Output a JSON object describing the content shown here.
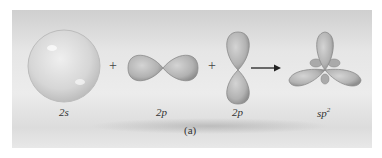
{
  "figure": {
    "caption": "(a)",
    "orbitals": [
      {
        "label_main": "2",
        "label_sub": "s",
        "shape": "sphere"
      },
      {
        "label_main": "2",
        "label_sub": "p",
        "shape": "horizontal-dumbbell"
      },
      {
        "label_main": "2",
        "label_sub": "p",
        "shape": "vertical-dumbbell"
      },
      {
        "label_main": "sp",
        "label_sup": "2",
        "shape": "trigonal-planar-hybrid"
      }
    ],
    "operators": [
      "+",
      "+"
    ],
    "arrow": "→",
    "colors": {
      "orbital_fill": "#b9b9b9",
      "orbital_edge": "#8a8a8a",
      "background": "#e4e4e4"
    }
  }
}
